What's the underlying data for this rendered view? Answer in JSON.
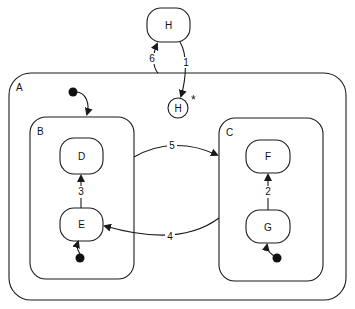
{
  "diagram": {
    "type": "statechart",
    "states": {
      "A": {
        "label": "A"
      },
      "B": {
        "label": "B"
      },
      "C": {
        "label": "C"
      },
      "D": {
        "label": "D"
      },
      "E": {
        "label": "E"
      },
      "F": {
        "label": "F"
      },
      "G": {
        "label": "G"
      },
      "H_top": {
        "label": "H"
      },
      "H_history": {
        "label": "H",
        "marker": "*"
      }
    },
    "transitions": [
      {
        "label": "1",
        "from": "H",
        "to": "H*"
      },
      {
        "label": "2",
        "from": "G",
        "to": "F"
      },
      {
        "label": "3",
        "from": "E",
        "to": "D"
      },
      {
        "label": "4",
        "from": "C",
        "to": "E"
      },
      {
        "label": "5",
        "from": "B",
        "to": "C"
      },
      {
        "label": "6",
        "from": "A",
        "to": "H"
      }
    ],
    "colors": {
      "stroke": "#1a1a1a",
      "background": "#ffffff"
    }
  }
}
